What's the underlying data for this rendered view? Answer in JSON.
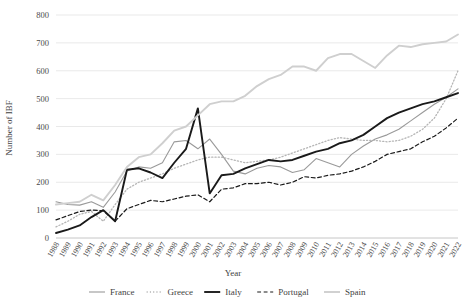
{
  "chart_data": {
    "type": "line",
    "title": "",
    "xlabel": "Year",
    "ylabel": "Number of IBF",
    "ylim": [
      0,
      800
    ],
    "ytick_step": 100,
    "grid": true,
    "legend_position": "bottom",
    "categories": [
      "1988",
      "1989",
      "1990",
      "1991",
      "1992",
      "1993",
      "1994",
      "1995",
      "1996",
      "1997",
      "1998",
      "1999",
      "2000",
      "2001",
      "2002",
      "2003",
      "2004",
      "2005",
      "2006",
      "2007",
      "2008",
      "2009",
      "2010",
      "2011",
      "2012",
      "2013",
      "2014",
      "2015",
      "2016",
      "2017",
      "2018",
      "2019",
      "2020",
      "2021",
      "2022"
    ],
    "yticks": [
      0,
      100,
      200,
      300,
      400,
      500,
      600,
      700,
      800
    ],
    "series": [
      {
        "name": "France",
        "color": "#9a9a9a",
        "style": "solid",
        "width": 1.1,
        "values": [
          130,
          120,
          118,
          130,
          110,
          165,
          240,
          255,
          250,
          270,
          345,
          350,
          320,
          355,
          300,
          240,
          230,
          250,
          260,
          255,
          235,
          245,
          285,
          270,
          255,
          300,
          330,
          355,
          370,
          390,
          420,
          450,
          480,
          505,
          535
        ]
      },
      {
        "name": "Greece",
        "color": "#b5b5b5",
        "style": "dotted",
        "width": 1.3,
        "values": [
          40,
          60,
          85,
          95,
          60,
          120,
          175,
          200,
          215,
          230,
          250,
          265,
          280,
          290,
          290,
          280,
          270,
          275,
          280,
          290,
          305,
          320,
          335,
          350,
          360,
          355,
          350,
          350,
          345,
          350,
          365,
          390,
          430,
          500,
          600
        ]
      },
      {
        "name": "Italy",
        "color": "#1a1a1a",
        "style": "solid",
        "width": 1.9,
        "values": [
          18,
          30,
          45,
          75,
          100,
          60,
          245,
          250,
          235,
          215,
          270,
          320,
          465,
          160,
          225,
          230,
          250,
          265,
          280,
          275,
          280,
          295,
          310,
          320,
          340,
          350,
          370,
          400,
          430,
          450,
          465,
          480,
          490,
          505,
          520
        ]
      },
      {
        "name": "Portugal",
        "color": "#1a1a1a",
        "style": "dashed",
        "width": 1.2,
        "values": [
          65,
          80,
          95,
          100,
          98,
          60,
          105,
          120,
          135,
          130,
          140,
          150,
          155,
          130,
          175,
          180,
          195,
          195,
          200,
          190,
          200,
          220,
          215,
          225,
          230,
          240,
          255,
          275,
          300,
          310,
          320,
          345,
          365,
          395,
          430
        ]
      },
      {
        "name": "Spain",
        "color": "#cfcfcf",
        "style": "solid",
        "width": 1.9,
        "values": [
          120,
          125,
          130,
          155,
          135,
          190,
          255,
          290,
          300,
          340,
          385,
          400,
          440,
          480,
          490,
          490,
          510,
          545,
          570,
          585,
          615,
          615,
          600,
          645,
          660,
          660,
          635,
          610,
          655,
          690,
          685,
          695,
          700,
          705,
          730
        ]
      }
    ]
  },
  "legend": {
    "items": [
      {
        "label": "France"
      },
      {
        "label": "Greece"
      },
      {
        "label": "Italy"
      },
      {
        "label": "Portugal"
      },
      {
        "label": "Spain"
      }
    ]
  }
}
